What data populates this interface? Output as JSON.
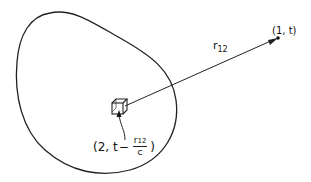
{
  "diagram": {
    "field_point": {
      "label": "(1, t)",
      "label_parts": {
        "open": "(",
        "index": "1",
        "sep": ", ",
        "time": "t",
        "close": ")"
      }
    },
    "distance": {
      "label_main": "r",
      "label_sub": "12"
    },
    "source_point": {
      "label_prefix": "(2, t",
      "minus": "−",
      "fraction_num_main": "r",
      "fraction_num_sub": "12",
      "fraction_den": "c",
      "label_suffix": ")"
    },
    "colors": {
      "stroke": "#222222",
      "background": "#ffffff"
    }
  }
}
